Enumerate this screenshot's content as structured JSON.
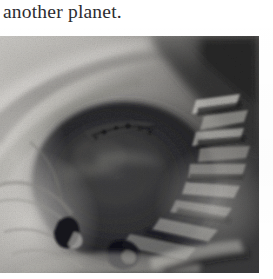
{
  "page": {
    "background_color": "#ffffff",
    "width": 273,
    "height": 279
  },
  "text": {
    "caption_line": "another planet."
  },
  "figure": {
    "alt": "grainy black and white photograph of a planetary surface",
    "media": "halftone-photograph",
    "tone": "grayscale",
    "colors": {
      "lightest": "#d8d6d2",
      "light": "#b9b7b3",
      "mid": "#8e8c88",
      "dark": "#4a4947",
      "darkest": "#17171a"
    }
  }
}
